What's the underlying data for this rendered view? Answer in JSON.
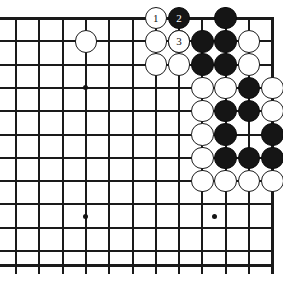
{
  "diagram": {
    "type": "go-board-problem",
    "board": {
      "cols": 12,
      "rows": 11,
      "origin_x": 16,
      "origin_y": 18,
      "spacing": 23.3,
      "line_color": "#1a1a1a",
      "edge_line_width": 3.0,
      "inner_line_width": 2.0,
      "background": "#ffffff",
      "edges": {
        "top": true,
        "left": false,
        "right": true,
        "bottom": true
      }
    },
    "star_points": [
      {
        "col": 3,
        "row": 3
      },
      {
        "col": 3,
        "row": 8.5
      },
      {
        "col": 8.5,
        "row": 8.5
      }
    ],
    "stones": [
      {
        "col": 3,
        "row": 1,
        "color": "white"
      },
      {
        "col": 6,
        "row": 1,
        "color": "white"
      },
      {
        "col": 7,
        "row": 1,
        "color": "black"
      },
      {
        "col": 8,
        "row": 1,
        "color": "black"
      },
      {
        "col": 9,
        "row": 1,
        "color": "black"
      },
      {
        "col": 10,
        "row": 1,
        "color": "white"
      },
      {
        "col": 6,
        "row": 2,
        "color": "white"
      },
      {
        "col": 7,
        "row": 2,
        "color": "white"
      },
      {
        "col": 8,
        "row": 2,
        "color": "black"
      },
      {
        "col": 9,
        "row": 2,
        "color": "black"
      },
      {
        "col": 10,
        "row": 2,
        "color": "white"
      },
      {
        "col": 9,
        "row": 0,
        "color": "black"
      },
      {
        "col": 8,
        "row": 3,
        "color": "white"
      },
      {
        "col": 9,
        "row": 3,
        "color": "white"
      },
      {
        "col": 10,
        "row": 3,
        "color": "black"
      },
      {
        "col": 11,
        "row": 3,
        "color": "white"
      },
      {
        "col": 8,
        "row": 4,
        "color": "white"
      },
      {
        "col": 9,
        "row": 4,
        "color": "black"
      },
      {
        "col": 10,
        "row": 4,
        "color": "black"
      },
      {
        "col": 11,
        "row": 4,
        "color": "white"
      },
      {
        "col": 8,
        "row": 5,
        "color": "white"
      },
      {
        "col": 9,
        "row": 5,
        "color": "black"
      },
      {
        "col": 11,
        "row": 5,
        "color": "black"
      },
      {
        "col": 8,
        "row": 6,
        "color": "white"
      },
      {
        "col": 9,
        "row": 6,
        "color": "black"
      },
      {
        "col": 10,
        "row": 6,
        "color": "black"
      },
      {
        "col": 11,
        "row": 6,
        "color": "black"
      },
      {
        "col": 8,
        "row": 7,
        "color": "white"
      },
      {
        "col": 9,
        "row": 7,
        "color": "white"
      },
      {
        "col": 10,
        "row": 7,
        "color": "white"
      },
      {
        "col": 11,
        "row": 7,
        "color": "white"
      }
    ],
    "move_stones": [
      {
        "col": 6,
        "row": 0,
        "color": "white",
        "label": "1"
      },
      {
        "col": 7,
        "row": 0,
        "color": "black",
        "label": "2"
      },
      {
        "col": 7,
        "row": 1,
        "color": "white",
        "label": "3"
      }
    ],
    "extra_right_stones": [
      {
        "col": 12,
        "row": 5,
        "color": "white"
      },
      {
        "col": 12,
        "row": 6,
        "color": "white"
      }
    ]
  }
}
